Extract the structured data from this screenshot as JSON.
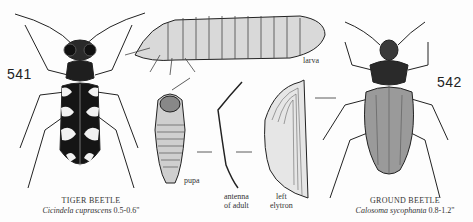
{
  "plate": {
    "figures": [
      {
        "number": "541",
        "common_name": "TIGER BEETLE",
        "scientific_name": "Cicindela cuprascens",
        "size": "0.5-0.6\""
      },
      {
        "number": "542",
        "common_name": "GROUND BEETLE",
        "scientific_name": "Calosoma sycophanta",
        "size": "0.8-1.2\""
      }
    ],
    "labels": {
      "larva": "larva",
      "pupa": "pupa",
      "antenna_line1": "antenna",
      "antenna_line2": "of adult",
      "elytron_line1": "left",
      "elytron_line2": "elytron"
    }
  }
}
